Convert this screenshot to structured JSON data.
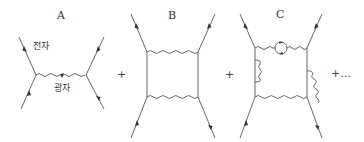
{
  "diagrams": [
    {
      "id": "A",
      "label": "A",
      "annotations": {
        "electron": "전자",
        "photon": "광자"
      }
    },
    {
      "id": "B",
      "label": "B"
    },
    {
      "id": "C",
      "label": "C"
    }
  ],
  "operators": {
    "plus_1": "+",
    "plus_2": "+",
    "plus_more": "+…"
  },
  "colors": {
    "line": "#555555",
    "text": "#333333",
    "background": "#ffffff"
  }
}
